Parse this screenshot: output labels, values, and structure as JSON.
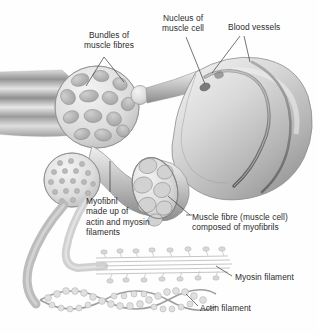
{
  "figure": {
    "background_color": "#ffffff",
    "ink_color": "#2c2c2c",
    "palette": {
      "tissue_light": "#e3e3e3",
      "tissue_mid": "#c2c2c2",
      "tissue_dark": "#9a9a9a",
      "tissue_shadow": "#6f6f6f",
      "outline": "#8a8a8a",
      "leader_line": "#3a3a3a"
    }
  },
  "labels": [
    {
      "id": "bundles-of-muscle-fibres",
      "text": "Bundles of\nmuscle fibres",
      "x": 66,
      "y": 30,
      "width": 86,
      "align": "center"
    },
    {
      "id": "nucleus-of-muscle-cell",
      "text": "Nucleus of\nmuscle cell",
      "x": 152,
      "y": 13,
      "width": 62,
      "align": "center"
    },
    {
      "id": "blood-vessels",
      "text": "Blood vessels",
      "x": 228,
      "y": 22,
      "width": 70,
      "align": "left"
    },
    {
      "id": "myofibril-made-up-of-actin-and-myosin-filaments",
      "text": "Myofibril\nmade up of\nactin and myosin\nfilaments",
      "x": 86,
      "y": 196,
      "width": 82,
      "align": "left"
    },
    {
      "id": "muscle-fibre-muscle-cell-composed-of-myofibrils",
      "text": "Muscle fibre (muscle cell)\ncomposed of myofibrils",
      "x": 192,
      "y": 212,
      "width": 124,
      "align": "left"
    },
    {
      "id": "myosin-filament",
      "text": "Myosin filament",
      "x": 235,
      "y": 272,
      "width": 80,
      "align": "left"
    },
    {
      "id": "actin-filament",
      "text": "Actin filament",
      "x": 200,
      "y": 303,
      "width": 76,
      "align": "left"
    }
  ],
  "structures": [
    {
      "id": "whole-muscle-striations",
      "name": "whole-muscle-striations"
    },
    {
      "id": "fascicle-cross-section",
      "name": "fascicle-cross-section"
    },
    {
      "id": "muscle-fibre-body",
      "name": "muscle-fibre-body"
    },
    {
      "id": "muscle-cell-nucleus",
      "name": "muscle-cell-nucleus"
    },
    {
      "id": "blood-vessel-upper",
      "name": "blood-vessel-upper"
    },
    {
      "id": "blood-vessel-lower",
      "name": "blood-vessel-lower"
    },
    {
      "id": "muscle-fibre-cut-end",
      "name": "muscle-fibre-cut-end"
    },
    {
      "id": "myofibril-cross-section",
      "name": "myofibril-cross-section"
    },
    {
      "id": "myosin-filament-bundle",
      "name": "myosin-filament-bundle"
    },
    {
      "id": "actin-filament-helix",
      "name": "actin-filament-helix"
    }
  ]
}
